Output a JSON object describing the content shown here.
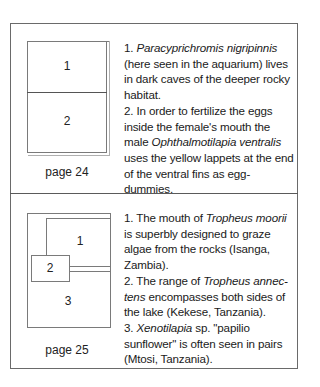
{
  "section1": {
    "diagram": {
      "panels": [
        "1",
        "2"
      ]
    },
    "page_label": "page 24",
    "captions": [
      {
        "number": "1.",
        "species": "Paracyprichromis nigripinnis",
        "text": "(here seen in the aquarium) lives in dark caves of the deeper rocky habitat."
      },
      {
        "number": "2.",
        "text_before": "In order to fertilize the eggs inside the female's mouth the male",
        "species": "Ophthalmotilapia ventralis",
        "text_after": "uses the yellow lappets at the end of the ventral fins as egg-dummies."
      }
    ]
  },
  "section2": {
    "diagram": {
      "panels": [
        "1",
        "2",
        "3"
      ]
    },
    "page_label": "page 25",
    "captions": [
      {
        "number": "1.",
        "text_before": "The mouth of",
        "species": "Tropheus moorii",
        "text_after": "is superbly designed to graze algae from the rocks (Isanga, Zambia)."
      },
      {
        "number": "2.",
        "text_before": "The range of",
        "species_part1": "Tropheus annec-",
        "species_part2": "tens",
        "text_after": "encompasses both sides of the lake (Kekese, Tanzania)."
      },
      {
        "number": "3.",
        "species": "Xenotilapia",
        "text_after": "sp. \"papilio sunflower\" is often seen in pairs (Mtosi, Tanzania)."
      }
    ]
  }
}
